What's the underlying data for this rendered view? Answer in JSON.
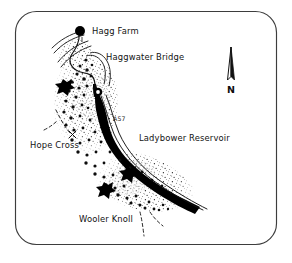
{
  "figure": {
    "kind": "hand-drawn-location-map",
    "width": 292,
    "height": 263,
    "background_color": "#ffffff",
    "ink_color": "#111111",
    "border": {
      "style": "rounded-rectangle",
      "color": "#3a3a3a",
      "corner_radius": 22
    }
  },
  "labels": {
    "hagg_farm": "Hagg Farm",
    "haggwater_bridge": "Haggwater Bridge",
    "road_a57": "A57",
    "ladybower_reservoir": "Ladybower Reservoir",
    "hope_cross": "Hope Cross",
    "wooler_knoll": "Wooler Knoll"
  },
  "compass": {
    "letter": "N",
    "orientation": "north-up",
    "style": "split-needle-arrow"
  },
  "features": {
    "settlement_marker": {
      "name": "Hagg Farm",
      "symbol": "filled-circle",
      "color": "#000000"
    },
    "water_body": {
      "name": "Ladybower Reservoir",
      "symbol": "solid-black-band",
      "color": "#000000"
    },
    "road": {
      "name": "A57",
      "symbol": "double-line-white-fill"
    },
    "scree": {
      "symbol": "stipple-texture",
      "description": "fine dot stipple hillside"
    },
    "boulder_trail": {
      "symbol": "large-dot-chain",
      "description": "chain of large black dots"
    },
    "cairn_markers": {
      "symbol": "star-blob",
      "count": 3
    },
    "footpaths": {
      "symbol": "dashed-line",
      "count": 3
    },
    "cross_marker": {
      "name": "Hope Cross",
      "symbol": "x-mark"
    }
  }
}
